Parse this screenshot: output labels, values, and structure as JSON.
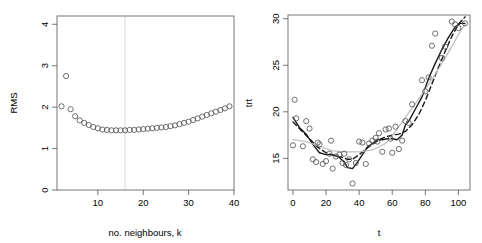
{
  "figure": {
    "type": "multi-panel-scatter-figure",
    "panels": 2,
    "background_color": "#ffffff",
    "point_color": "#555555",
    "axis_color": "#555555",
    "reference_line_color": "#d9d9d9"
  },
  "chart_data": [
    {
      "type": "scatter",
      "panel": "left",
      "title": "",
      "xlabel": "no. neighbours, k",
      "ylabel": "RMS",
      "xlim": [
        1,
        40
      ],
      "ylim": [
        0,
        4.2
      ],
      "xticks": [
        10,
        20,
        30,
        40
      ],
      "yticks": [
        0,
        1,
        2,
        3,
        4
      ],
      "xtick_labels": [
        "10",
        "20",
        "30",
        "40"
      ],
      "ytick_labels": [
        "0",
        "1",
        "2",
        "3",
        "4"
      ],
      "grid": false,
      "legend": "none",
      "marker": "open-circle",
      "annotations": [
        {
          "kind": "vertical-reference-line",
          "x": 16,
          "color": "#d9d9d9",
          "label": "selected k"
        }
      ],
      "x": [
        2,
        3,
        4,
        5,
        6,
        7,
        8,
        9,
        10,
        11,
        12,
        13,
        14,
        15,
        16,
        17,
        18,
        19,
        20,
        21,
        22,
        23,
        24,
        25,
        26,
        27,
        28,
        29,
        30,
        31,
        32,
        33,
        34,
        35,
        36,
        37,
        38,
        39
      ],
      "y": [
        2.02,
        2.75,
        1.95,
        1.78,
        1.68,
        1.62,
        1.57,
        1.52,
        1.49,
        1.46,
        1.45,
        1.44,
        1.44,
        1.44,
        1.44,
        1.45,
        1.45,
        1.46,
        1.47,
        1.48,
        1.49,
        1.5,
        1.51,
        1.52,
        1.54,
        1.56,
        1.59,
        1.62,
        1.65,
        1.69,
        1.73,
        1.77,
        1.81,
        1.85,
        1.89,
        1.93,
        1.97,
        2.02
      ]
    },
    {
      "type": "scatter",
      "panel": "right",
      "title": "",
      "xlabel": "t",
      "ylabel": "trt",
      "xlim": [
        -3,
        107
      ],
      "ylim": [
        11.6,
        30.4
      ],
      "xticks": [
        0,
        20,
        40,
        60,
        80,
        100
      ],
      "yticks": [
        15,
        20,
        25,
        30
      ],
      "xtick_labels": [
        "0",
        "20",
        "40",
        "60",
        "80",
        "100"
      ],
      "ytick_labels": [
        "15",
        "20",
        "25",
        "30"
      ],
      "grid": false,
      "legend": "none",
      "marker": "open-circle",
      "x": [
        0,
        1,
        2,
        6,
        8,
        10,
        12,
        14,
        15,
        16,
        18,
        20,
        22,
        23,
        24,
        26,
        28,
        30,
        31,
        32,
        34,
        36,
        38,
        40,
        42,
        44,
        46,
        48,
        50,
        51,
        52,
        54,
        56,
        58,
        59,
        60,
        62,
        64,
        66,
        68,
        70,
        72,
        78,
        80,
        82,
        84,
        86,
        90,
        92,
        96,
        98,
        100,
        104
      ],
      "y": [
        16.4,
        21.3,
        19.3,
        16.3,
        19.0,
        18.2,
        14.9,
        14.6,
        16.7,
        16.5,
        14.4,
        14.7,
        15.5,
        16.9,
        13.9,
        15.2,
        15.4,
        14.5,
        15.5,
        14.3,
        14.9,
        12.3,
        14.5,
        16.8,
        16.7,
        14.4,
        16.6,
        16.9,
        17.2,
        16.8,
        17.7,
        15.7,
        18.1,
        18.2,
        17.1,
        15.6,
        18.4,
        16.0,
        16.9,
        19.0,
        18.8,
        20.8,
        23.4,
        22.2,
        23.7,
        27.1,
        28.4,
        25.8,
        27.0,
        29.7,
        29.4,
        29.0,
        29.5
      ],
      "series": [
        {
          "name": "knn-smoother-solid",
          "style": "solid",
          "color": "#1a1a1a",
          "x": [
            0,
            4,
            8,
            12,
            16,
            20,
            24,
            28,
            31,
            33,
            36,
            39,
            42,
            45,
            48,
            51,
            54,
            57,
            60,
            63,
            66,
            68,
            70,
            74,
            78,
            82,
            86,
            90,
            94,
            98,
            101,
            104
          ],
          "y": [
            19.4,
            18.3,
            17.6,
            16.5,
            15.6,
            15.4,
            15.4,
            15.1,
            14.6,
            14.0,
            13.9,
            14.6,
            15.4,
            16.2,
            16.6,
            17.0,
            17.0,
            17.1,
            17.1,
            17.0,
            17.5,
            18.6,
            19.0,
            20.3,
            21.6,
            23.6,
            25.2,
            26.7,
            28.0,
            29.1,
            29.5,
            29.5
          ]
        },
        {
          "name": "smoother-dashed",
          "style": "dashed",
          "color": "#1a1a1a",
          "x": [
            0,
            5,
            10,
            15,
            20,
            25,
            30,
            33,
            36,
            40,
            44,
            48,
            52,
            56,
            60,
            64,
            68,
            72,
            76,
            80,
            84,
            88,
            92,
            96,
            100,
            104
          ],
          "y": [
            18.9,
            18.0,
            17.1,
            16.2,
            15.6,
            15.3,
            15.1,
            14.9,
            14.9,
            15.4,
            16.0,
            16.5,
            17.0,
            17.3,
            17.5,
            17.6,
            17.9,
            18.6,
            19.7,
            21.2,
            23.0,
            24.8,
            26.5,
            28.1,
            29.4,
            30.2
          ]
        },
        {
          "name": "smoother-gray",
          "style": "solid",
          "color": "#c0c0c0",
          "x": [
            0,
            8,
            16,
            24,
            32,
            40,
            48,
            56,
            60,
            64,
            68,
            72,
            76,
            80,
            84,
            88,
            92,
            96,
            100,
            104
          ],
          "y": [
            17.0,
            16.8,
            16.3,
            15.8,
            15.7,
            15.7,
            15.9,
            16.6,
            17.4,
            18.4,
            19.4,
            20.4,
            21.4,
            22.4,
            23.5,
            24.6,
            25.8,
            27.0,
            28.3,
            29.4
          ]
        }
      ]
    }
  ]
}
